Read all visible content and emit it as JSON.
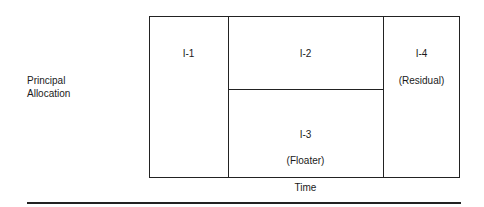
{
  "diagram": {
    "y_axis_label_line1": "Principal",
    "y_axis_label_line2": "Allocation",
    "x_axis_label": "Time",
    "tranches": [
      {
        "id": "I-1",
        "name": "I-1",
        "note": ""
      },
      {
        "id": "I-2",
        "name": "I-2",
        "note": ""
      },
      {
        "id": "I-3",
        "name": "I-3",
        "note": "(Floater)"
      },
      {
        "id": "I-4",
        "name": "I-4",
        "note": "(Residual)"
      }
    ]
  }
}
